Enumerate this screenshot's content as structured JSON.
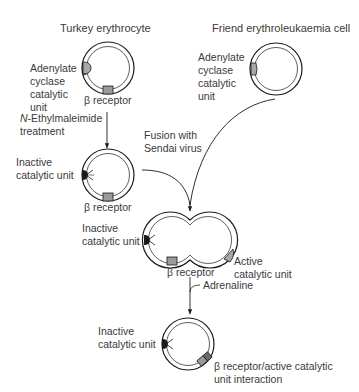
{
  "diagram": {
    "title_left": "Turkey erythrocyte",
    "title_right": "Friend erythroleukaemia cell",
    "cells": [
      {
        "id": "turkey-erythrocyte",
        "labels": {
          "catalytic": [
            "Adenylate",
            "cyclase",
            "catalytic",
            "unit"
          ],
          "receptor": "β receptor"
        }
      },
      {
        "id": "friend-cell",
        "labels": {
          "catalytic": [
            "Adenylate",
            "cyclase",
            "catalytic",
            "unit"
          ]
        }
      },
      {
        "id": "nem-treated-erythrocyte",
        "labels": {
          "catalytic": [
            "Inactive",
            "catalytic unit"
          ],
          "receptor": "β receptor"
        }
      },
      {
        "id": "fused-cell",
        "labels": {
          "inactive": [
            "Inactive",
            "catalytic unit"
          ],
          "receptor": "β receptor",
          "active": [
            "Active",
            "catalytic unit"
          ]
        }
      },
      {
        "id": "final-cell",
        "labels": {
          "inactive": [
            "Inactive",
            "catalytic unit"
          ],
          "interaction": [
            "β receptor/active catalytic",
            "unit interaction"
          ]
        }
      }
    ],
    "steps": {
      "nem": {
        "italic_prefix": "N",
        "rest": "-Ethylmaleimide",
        "line2": "treatment"
      },
      "fusion": [
        "Fusion with",
        "Sendai virus"
      ],
      "adrenaline": "Adrenaline"
    },
    "colors": {
      "line": "#1a1a1a",
      "receptor_fill": "#9a9a9a",
      "catalytic_fill": "#a8a8a8",
      "text": "#3a3a3a"
    }
  }
}
